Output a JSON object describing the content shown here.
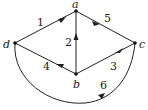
{
  "graph": {
    "directed": true,
    "vertices": [
      {
        "id": "a",
        "label": "a"
      },
      {
        "id": "b",
        "label": "b"
      },
      {
        "id": "c",
        "label": "c"
      },
      {
        "id": "d",
        "label": "d"
      }
    ],
    "edges": [
      {
        "label": "1",
        "from": "d",
        "to": "a"
      },
      {
        "label": "2",
        "from": "b",
        "to": "a"
      },
      {
        "label": "3",
        "from": "c",
        "to": "b"
      },
      {
        "label": "4",
        "from": "b",
        "to": "d"
      },
      {
        "label": "5",
        "from": "a",
        "to": "c"
      },
      {
        "label": "6",
        "from": "d",
        "to": "c"
      }
    ]
  },
  "labels": {
    "a": "a",
    "b": "b",
    "c": "c",
    "d": "d",
    "e1": "1",
    "e2": "2",
    "e3": "3",
    "e4": "4",
    "e5": "5",
    "e6": "6"
  }
}
